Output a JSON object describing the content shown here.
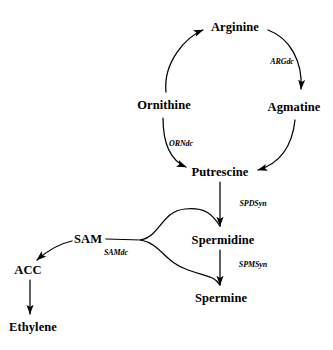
{
  "diagram": {
    "background_color": "#ffffff",
    "stroke_color": "#000000",
    "nodes": [
      {
        "id": "arginine",
        "label": "Arginine",
        "x": 235,
        "y": 27
      },
      {
        "id": "agmatine",
        "label": "Agmatine",
        "x": 294,
        "y": 107
      },
      {
        "id": "ornithine",
        "label": "Ornithine",
        "x": 164,
        "y": 105
      },
      {
        "id": "putrescine",
        "label": "Putrescine",
        "x": 220,
        "y": 172
      },
      {
        "id": "sam",
        "label": "SAM",
        "x": 88,
        "y": 239
      },
      {
        "id": "spermidine",
        "label": "Spermidine",
        "x": 223,
        "y": 240
      },
      {
        "id": "spermine",
        "label": "Spermine",
        "x": 221,
        "y": 298
      },
      {
        "id": "acc",
        "label": "ACC",
        "x": 28,
        "y": 270
      },
      {
        "id": "ethylene",
        "label": "Ethylene",
        "x": 33,
        "y": 327
      }
    ],
    "enzymes": [
      {
        "id": "argdc",
        "label": "ARGdc",
        "x": 282,
        "y": 61
      },
      {
        "id": "orndc",
        "label": "ORNdc",
        "x": 181,
        "y": 143
      },
      {
        "id": "spdsyn",
        "label": "SPDSyn",
        "x": 253,
        "y": 203
      },
      {
        "id": "spmsyn",
        "label": "SPMSyn",
        "x": 253,
        "y": 264
      },
      {
        "id": "samdc",
        "label": "SAMdc",
        "x": 116,
        "y": 252
      }
    ],
    "edges": [
      {
        "id": "ornithine-to-arginine",
        "from": "ornithine",
        "to": "arginine"
      },
      {
        "id": "arginine-to-agmatine",
        "from": "arginine",
        "to": "agmatine"
      },
      {
        "id": "agmatine-to-putrescine",
        "from": "agmatine",
        "to": "putrescine"
      },
      {
        "id": "ornithine-to-putrescine",
        "from": "ornithine",
        "to": "putrescine"
      },
      {
        "id": "putrescine-to-spermidine",
        "from": "putrescine",
        "to": "spermidine"
      },
      {
        "id": "spermidine-to-spermine",
        "from": "spermidine",
        "to": "spermine"
      },
      {
        "id": "sam-to-acc",
        "from": "sam",
        "to": "acc"
      },
      {
        "id": "acc-to-ethylene",
        "from": "acc",
        "to": "ethylene"
      },
      {
        "id": "samdc-to-spermidine-arm",
        "from": "sam",
        "to": "spermidine"
      },
      {
        "id": "samdc-to-spermine-arm",
        "from": "sam",
        "to": "spermine"
      }
    ]
  }
}
